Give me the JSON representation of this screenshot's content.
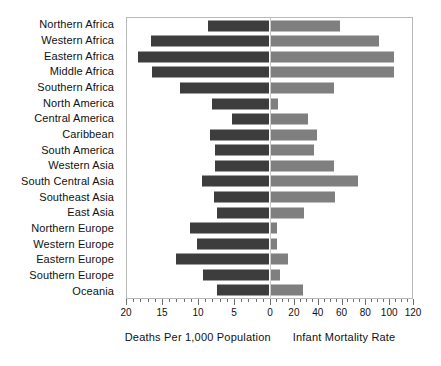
{
  "chart_data": {
    "type": "bar",
    "subtype": "diverging-population-pyramid",
    "title": "",
    "subtitle": "",
    "orientation": "horizontal",
    "grid": false,
    "legend_position": "none",
    "categories": [
      "Northern Africa",
      "Western Africa",
      "Eastern Africa",
      "Middle Africa",
      "Southern Africa",
      "North America",
      "Central America",
      "Caribbean",
      "South America",
      "Western Asia",
      "South Central Asia",
      "Southeast Asia",
      "East Asia",
      "Northern Europe",
      "Western Europe",
      "Eastern Europe",
      "Southern Europe",
      "Oceania"
    ],
    "series": [
      {
        "name": "Deaths Per 1,000 Population",
        "side": "left",
        "color": "#3d3d3d",
        "axis_label": "Deaths Per 1,000 Population",
        "axis_min": 0,
        "axis_max": 20,
        "axis_ticks": [
          20,
          15,
          10,
          5,
          0
        ],
        "values": [
          8.5,
          16.5,
          18.3,
          16.4,
          12.5,
          8.0,
          5.2,
          8.3,
          7.5,
          7.6,
          9.4,
          7.7,
          7.2,
          11.0,
          10.0,
          13.0,
          9.2,
          7.3
        ]
      },
      {
        "name": "Infant Mortality Rate",
        "side": "right",
        "color": "#7f7f7f",
        "axis_label": "Infant Mortality Rate",
        "axis_min": 0,
        "axis_max": 120,
        "axis_ticks": [
          0,
          20,
          40,
          60,
          80,
          100,
          120
        ],
        "values": [
          59,
          92,
          105,
          105,
          54,
          7,
          32,
          40,
          37,
          54,
          74,
          55,
          29,
          6,
          6,
          15,
          8,
          28
        ]
      }
    ],
    "xlabel_left": "Deaths Per 1,000 Population",
    "xlabel_right": "Infant Mortality Rate",
    "ylabel": ""
  },
  "axis": {
    "left_ticks": [
      {
        "label": "20",
        "value": 20
      },
      {
        "label": "15",
        "value": 15
      },
      {
        "label": "10",
        "value": 10
      },
      {
        "label": "5",
        "value": 5
      },
      {
        "label": "0",
        "value": 0
      }
    ],
    "right_ticks": [
      {
        "label": "20",
        "value": 20
      },
      {
        "label": "40",
        "value": 40
      },
      {
        "label": "60",
        "value": 60
      },
      {
        "label": "80",
        "value": 80
      },
      {
        "label": "100",
        "value": 100
      },
      {
        "label": "120",
        "value": 120
      }
    ],
    "caption_left": "Deaths Per 1,000 Population",
    "caption_right": "Infant Mortality Rate"
  },
  "colors": {
    "bar_left": "#3d3d3d",
    "bar_right": "#7f7f7f",
    "plot_border": "#b9b9b9",
    "background": "#ffffff",
    "text": "#111111"
  }
}
